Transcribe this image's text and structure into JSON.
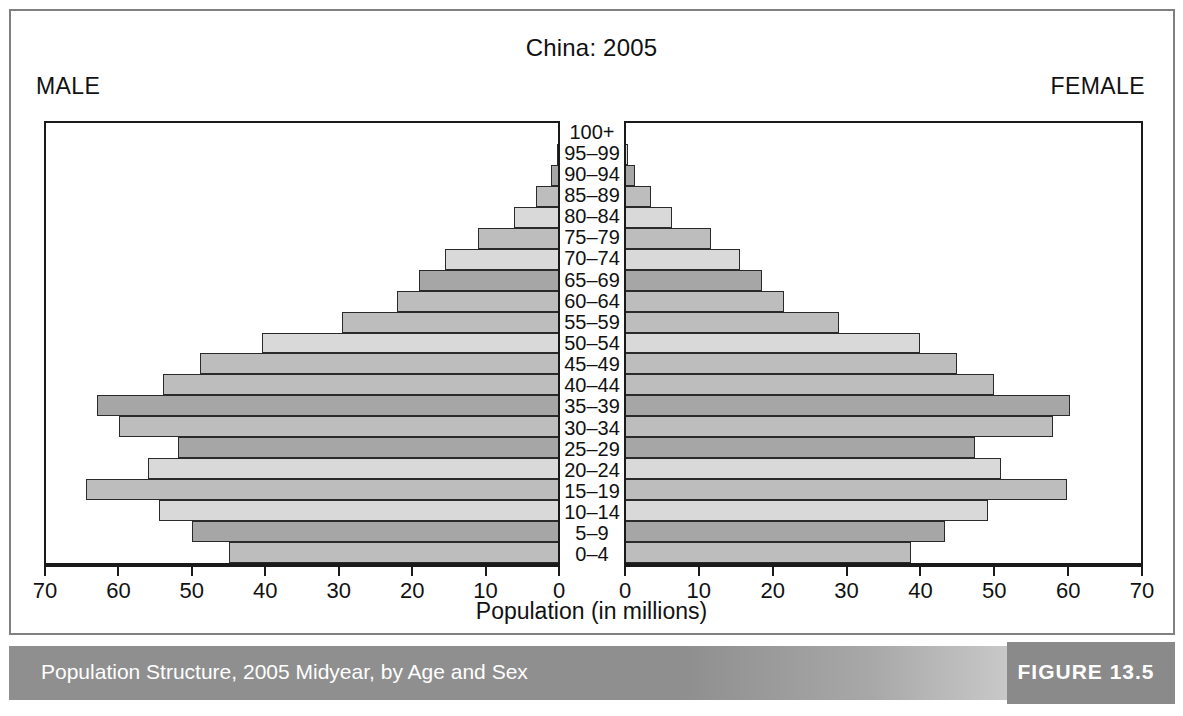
{
  "header": {
    "title": "China: 2005",
    "male_label": "MALE",
    "female_label": "FEMALE"
  },
  "axis": {
    "caption": "Population (in millions)",
    "male_ticks": [
      "70",
      "60",
      "50",
      "40",
      "30",
      "20",
      "10",
      "0"
    ],
    "female_ticks": [
      "0",
      "10",
      "20",
      "30",
      "40",
      "50",
      "60",
      "70"
    ]
  },
  "caption": {
    "text": "Population Structure, 2005 Midyear, by Age and Sex",
    "figure_number": "FIGURE 13.5"
  },
  "colors": {
    "bar_dark": "#a6a6a6",
    "bar_medium": "#bdbdbd",
    "bar_light": "#d9d9d9",
    "bar_outline": "#2a2a2a",
    "frame": "#808080",
    "plot_border": "#1a1a1a",
    "caption_bar": "#8f8f8f",
    "figure_box": "#8a8a8a"
  },
  "chart_data": {
    "type": "bar",
    "subtype": "population-pyramid",
    "title": "China: 2005",
    "xlabel": "Population (in millions)",
    "ylabel": "Age group",
    "xlim": [
      0,
      70
    ],
    "xtick_step": 10,
    "grid": false,
    "categories": [
      "0-4",
      "5-9",
      "10-14",
      "15-19",
      "20-24",
      "25-29",
      "30-34",
      "35-39",
      "40-44",
      "45-49",
      "50-54",
      "55-59",
      "60-64",
      "65-69",
      "70-74",
      "75-79",
      "80-84",
      "85-89",
      "90-94",
      "95-99",
      "100+"
    ],
    "series": [
      {
        "name": "MALE",
        "direction": "left",
        "values": [
          45.0,
          50.0,
          54.5,
          64.5,
          56.0,
          52.0,
          60.0,
          63.0,
          54.0,
          49.0,
          40.5,
          29.5,
          22.0,
          19.0,
          15.5,
          11.0,
          6.0,
          3.0,
          1.0,
          0.2,
          0.03
        ]
      },
      {
        "name": "FEMALE",
        "direction": "right",
        "values": [
          38.7,
          43.4,
          49.2,
          60.0,
          51.0,
          47.5,
          58.0,
          60.4,
          50.0,
          45.0,
          40.0,
          29.0,
          21.5,
          18.5,
          15.5,
          11.5,
          6.3,
          3.4,
          1.2,
          0.3,
          0.05
        ]
      }
    ],
    "bar_shades": [
      "medium",
      "dark",
      "light",
      "medium",
      "light",
      "dark",
      "medium",
      "dark",
      "medium",
      "medium",
      "light",
      "medium",
      "medium",
      "dark",
      "light",
      "medium",
      "light",
      "medium",
      "dark",
      "light",
      "medium"
    ]
  }
}
